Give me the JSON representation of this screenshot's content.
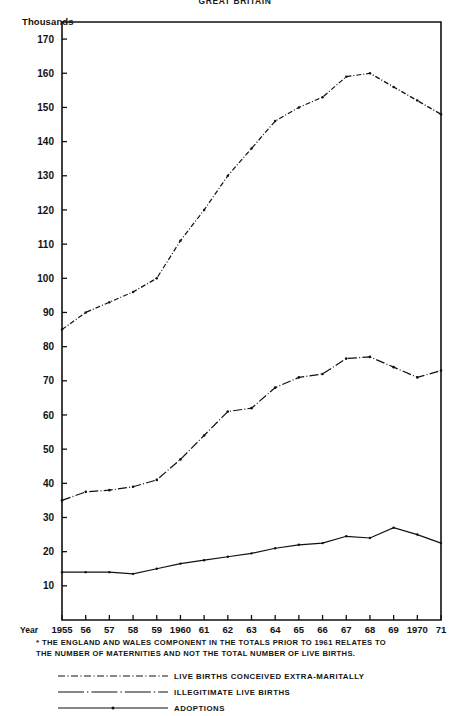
{
  "header": {
    "title": "GREAT BRITAIN",
    "unit_label": "Thousands"
  },
  "footnote": {
    "marker": "*",
    "line1": "THE ENGLAND AND WALES COMPONENT IN THE TOTALS PRIOR TO 1961 RELATES TO",
    "line2": "THE NUMBER OF MATERNITIES AND NOT THE TOTAL NUMBER OF LIVE BIRTHS."
  },
  "axis": {
    "year_word": "Year"
  },
  "legend": {
    "items": [
      {
        "label": "LIVE BIRTHS CONCEIVED EXTRA-MARITALLY",
        "style": "dashdot-fine",
        "key": "legend-key-live-births"
      },
      {
        "label": "ILLEGITIMATE LIVE BIRTHS",
        "style": "dashdot-long",
        "key": "legend-key-illegitimate"
      },
      {
        "label": "ADOPTIONS",
        "style": "solid-dot",
        "key": "legend-key-adoptions"
      }
    ]
  },
  "chart_data": {
    "type": "line",
    "title": "GREAT BRITAIN",
    "xlabel": "Year",
    "ylabel": "Thousands",
    "xlim": [
      1955,
      1971
    ],
    "ylim": [
      0,
      175
    ],
    "ytick_values": [
      10,
      20,
      30,
      40,
      50,
      60,
      70,
      80,
      90,
      100,
      110,
      120,
      130,
      140,
      150,
      160,
      170
    ],
    "grid": false,
    "legend_position": "below",
    "x": [
      1955,
      1956,
      1957,
      1958,
      1959,
      1960,
      1961,
      1962,
      1963,
      1964,
      1965,
      1966,
      1967,
      1968,
      1969,
      1970,
      1971
    ],
    "xtick_labels": [
      "1955",
      "56",
      "57",
      "58",
      "59",
      "1960",
      "61",
      "62",
      "63",
      "64",
      "65",
      "66",
      "67",
      "68",
      "69",
      "1970",
      "71"
    ],
    "series": [
      {
        "name": "LIVE BIRTHS CONCEIVED EXTRA-MARITALLY",
        "values": [
          85,
          90,
          93,
          96,
          100,
          111,
          120,
          130,
          138,
          146,
          150,
          153,
          159,
          160,
          156,
          152,
          148
        ]
      },
      {
        "name": "ILLEGITIMATE LIVE BIRTHS",
        "values": [
          35,
          37.5,
          38,
          39,
          41,
          47,
          54,
          61,
          62,
          68,
          71,
          72,
          76.5,
          77,
          74,
          71,
          73
        ]
      },
      {
        "name": "ADOPTIONS",
        "values": [
          14,
          14,
          14,
          13.5,
          15,
          16.5,
          17.5,
          18.5,
          19.5,
          21,
          22,
          22.5,
          24.5,
          24,
          27,
          25,
          22.5
        ]
      }
    ]
  }
}
